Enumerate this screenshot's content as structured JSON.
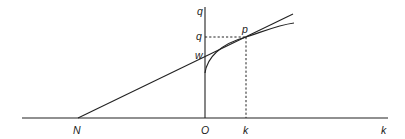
{
  "diagram": {
    "type": "geometric-construction",
    "axes": {
      "horizontal": {
        "x1": 22,
        "x2": 388,
        "y": 118
      },
      "vertical": {
        "x": 205,
        "y1": 7,
        "y2": 118
      }
    },
    "points": {
      "N": {
        "x": 78,
        "y": 118
      },
      "O": {
        "x": 205,
        "y": 118
      },
      "w": {
        "x": 205,
        "y": 59
      },
      "p": {
        "x": 246,
        "y": 37
      },
      "k": {
        "x": 246,
        "y": 118
      }
    },
    "tangent_line": {
      "x1": 78,
      "y1": 118,
      "x2": 293,
      "y2": 14
    },
    "curve": {
      "start": {
        "x": 205,
        "y": 73
      },
      "through": {
        "x": 246,
        "y": 37
      },
      "end": {
        "x": 294,
        "y": 23
      }
    },
    "labels": [
      {
        "id": "label-q-axis",
        "text": "q",
        "x": 197,
        "y": 15
      },
      {
        "id": "label-q-value",
        "text": "q",
        "x": 196,
        "y": 40
      },
      {
        "id": "label-w",
        "text": "w",
        "x": 195,
        "y": 59
      },
      {
        "id": "label-p",
        "text": "p",
        "x": 242,
        "y": 33
      },
      {
        "id": "label-N",
        "text": "N",
        "x": 73,
        "y": 134
      },
      {
        "id": "label-O",
        "text": "O",
        "x": 201,
        "y": 134
      },
      {
        "id": "label-k-value",
        "text": "k",
        "x": 243,
        "y": 134
      },
      {
        "id": "label-k-axis",
        "text": "k",
        "x": 381,
        "y": 134
      }
    ],
    "colors": {
      "stroke": "#222222",
      "background": "#ffffff"
    }
  }
}
